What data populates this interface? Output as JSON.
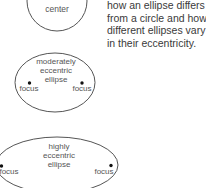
{
  "caption": {
    "lines": [
      "how an ellipse differs",
      "from a circle and how",
      "different ellipses vary",
      "in their eccentricity."
    ]
  },
  "shapes": {
    "circle": {
      "label": "center"
    },
    "moderate": {
      "label_lines": [
        "moderately",
        "eccentric",
        "ellipse"
      ],
      "focus_left": "focus",
      "focus_right": "focus"
    },
    "high": {
      "label_lines": [
        "highly",
        "eccentric",
        "ellipse"
      ],
      "focus_left": "focus",
      "focus_right": "focus"
    }
  },
  "colors": {
    "stroke": "#555555",
    "text": "#3a3a3a",
    "dot": "#111111"
  }
}
